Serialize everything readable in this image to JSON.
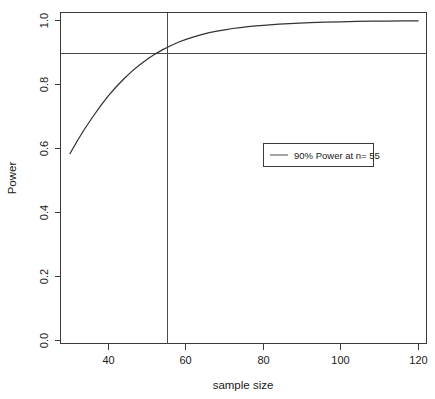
{
  "chart_data": {
    "type": "line",
    "title": "",
    "subtitle": "",
    "xlabel": "sample size",
    "ylabel": "Power",
    "xlim": [
      30,
      121
    ],
    "ylim": [
      0.0,
      1.02
    ],
    "grid": false,
    "legend_position": "center-right",
    "x_ticks": [
      40,
      60,
      80,
      100,
      120
    ],
    "x_tick_labels": [
      "40",
      "60",
      "80",
      "100",
      "120"
    ],
    "y_ticks": [
      0.0,
      0.2,
      0.4,
      0.6,
      0.8,
      1.0
    ],
    "y_tick_labels": [
      "0.0",
      "0.2",
      "0.4",
      "0.6",
      "0.8",
      "1.0"
    ],
    "series": [
      {
        "name": "power curve",
        "x": [
          30,
          32,
          34,
          36,
          38,
          40,
          42,
          44,
          46,
          48,
          50,
          52,
          54,
          55,
          56,
          58,
          60,
          62,
          64,
          66,
          68,
          70,
          72,
          74,
          76,
          78,
          80,
          84,
          88,
          92,
          96,
          100,
          104,
          108,
          112,
          116,
          120
        ],
        "values": [
          0.583,
          0.625,
          0.664,
          0.7,
          0.734,
          0.765,
          0.793,
          0.818,
          0.841,
          0.861,
          0.879,
          0.895,
          0.909,
          0.915,
          0.921,
          0.932,
          0.941,
          0.949,
          0.956,
          0.962,
          0.967,
          0.971,
          0.975,
          0.978,
          0.981,
          0.983,
          0.985,
          0.989,
          0.991,
          0.993,
          0.995,
          0.996,
          0.997,
          0.998,
          0.998,
          0.999,
          0.999
        ]
      }
    ],
    "reference_lines": [
      {
        "name": "power-threshold",
        "orientation": "horizontal",
        "value": 0.9
      },
      {
        "name": "required-sample-size",
        "orientation": "vertical",
        "value": 55
      }
    ],
    "legend": {
      "entries": [
        {
          "label": "90% Power at n= 55",
          "marker": "line"
        }
      ]
    },
    "annotations": {
      "target_power_percent": "90%",
      "required_n": "55"
    }
  },
  "colors": {
    "curve": "#333333",
    "reference": "#4a4a4a",
    "axis": "#3a3a3a",
    "text": "#1a1a1a",
    "background": "#ffffff"
  }
}
